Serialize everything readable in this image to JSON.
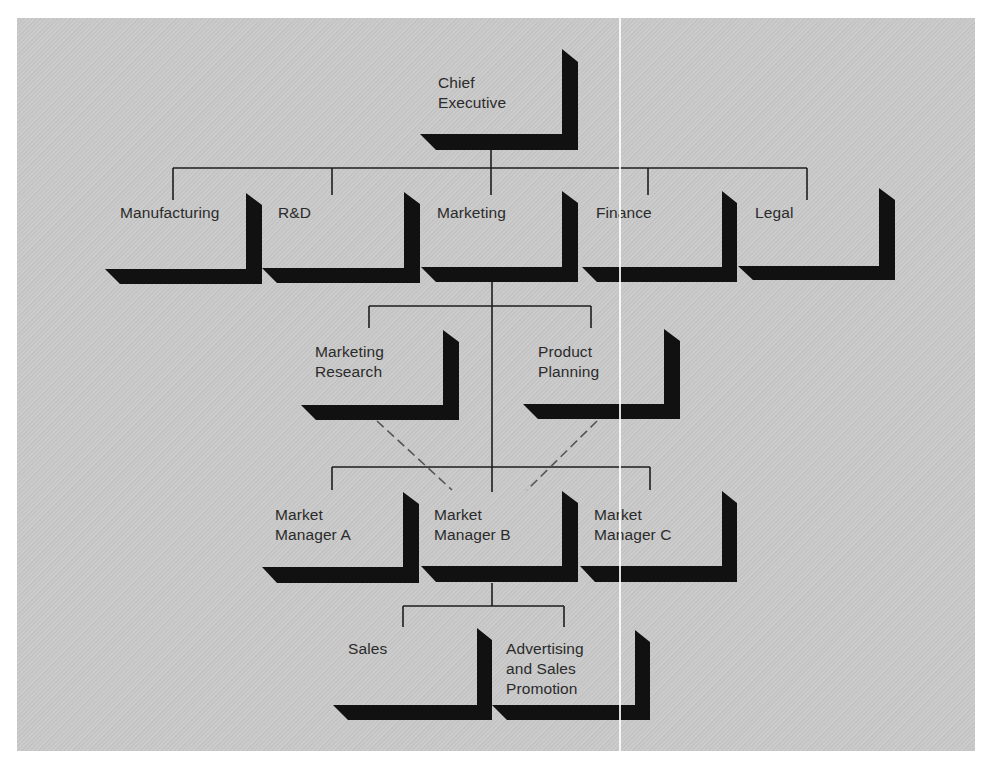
{
  "diagram": {
    "type": "org-chart",
    "colors": {
      "background": "#c9c9c9",
      "box_shadow": "#111111",
      "line": "#1e1e1e",
      "dashed_line": "#555555",
      "text": "#2b2b2b"
    },
    "nodes": [
      {
        "id": "chief-executive",
        "label": "Chief\nExecutive",
        "level": 0,
        "parent": null
      },
      {
        "id": "manufacturing",
        "label": "Manufacturing",
        "level": 1,
        "parent": "chief-executive"
      },
      {
        "id": "rd",
        "label": "R&D",
        "level": 1,
        "parent": "chief-executive"
      },
      {
        "id": "marketing",
        "label": "Marketing",
        "level": 1,
        "parent": "chief-executive"
      },
      {
        "id": "finance",
        "label": "Finance",
        "level": 1,
        "parent": "chief-executive"
      },
      {
        "id": "legal",
        "label": "Legal",
        "level": 1,
        "parent": "chief-executive"
      },
      {
        "id": "marketing-research",
        "label": "Marketing\nResearch",
        "level": 2,
        "parent": "marketing"
      },
      {
        "id": "product-planning",
        "label": "Product\nPlanning",
        "level": 2,
        "parent": "marketing"
      },
      {
        "id": "market-manager-a",
        "label": "Market\nManager A",
        "level": 3,
        "parent": "marketing"
      },
      {
        "id": "market-manager-b",
        "label": "Market\nManager B",
        "level": 3,
        "parent": "marketing"
      },
      {
        "id": "market-manager-c",
        "label": "Market\nManager C",
        "level": 3,
        "parent": "marketing"
      },
      {
        "id": "sales",
        "label": "Sales",
        "level": 4,
        "parent": "market-manager-b"
      },
      {
        "id": "advertising",
        "label": "Advertising\nand Sales\nPromotion",
        "level": 4,
        "parent": "market-manager-b"
      }
    ],
    "dashed_links": [
      {
        "from": "marketing-research",
        "to": "market-manager-b",
        "style": "dashed"
      },
      {
        "from": "product-planning",
        "to": "market-manager-b",
        "style": "dashed"
      }
    ]
  }
}
